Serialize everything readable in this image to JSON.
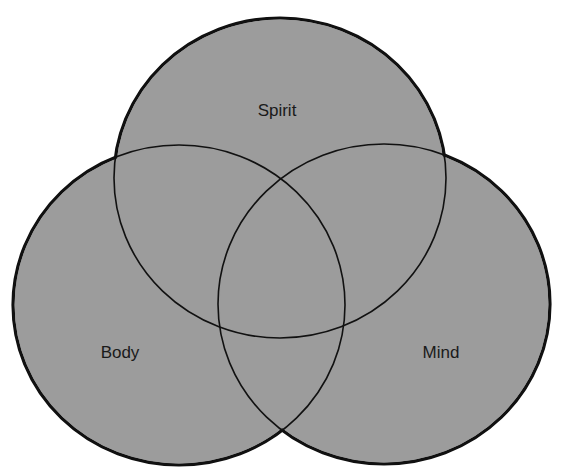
{
  "diagram": {
    "type": "venn",
    "colors": {
      "background": "#ffffff",
      "fill": "#9c9c9c",
      "stroke": "#111111"
    },
    "sets": [
      {
        "id": "spirit",
        "label": "Spirit",
        "cx": 280,
        "cy": 178,
        "rx": 166,
        "ry": 160,
        "label_x": 277,
        "label_y": 116
      },
      {
        "id": "body",
        "label": "Body",
        "cx": 179,
        "cy": 305,
        "rx": 166,
        "ry": 160,
        "label_x": 120,
        "label_y": 358
      },
      {
        "id": "mind",
        "label": "Mind",
        "cx": 384,
        "cy": 304,
        "rx": 166,
        "ry": 160,
        "label_x": 441,
        "label_y": 358
      }
    ]
  }
}
